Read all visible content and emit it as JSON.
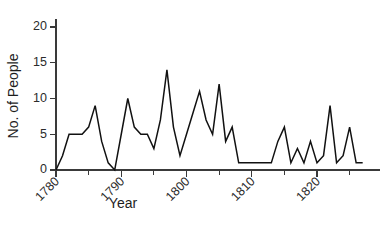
{
  "chart_data": {
    "type": "line",
    "title": "",
    "xlabel": "Year",
    "ylabel": "No. of People",
    "xlim": [
      1780,
      1827
    ],
    "ylim": [
      0,
      22
    ],
    "grid": false,
    "legend": null,
    "y_ticks": [
      0,
      5,
      10,
      15,
      20
    ],
    "y_tick_labels": [
      "0",
      "5",
      "10",
      "15",
      "20"
    ],
    "x_major_ticks": [
      1780,
      1790,
      1800,
      1810,
      1820
    ],
    "x_major_tick_labels": [
      "1780",
      "1790",
      "1800",
      "1810",
      "1820"
    ],
    "x_minor_ticks": [
      1785,
      1795,
      1805,
      1815,
      1825
    ],
    "x_tick_label_rotation": -45,
    "series": [
      {
        "name": "No. of People",
        "color": "#111111",
        "x": [
          1780,
          1781,
          1782,
          1783,
          1784,
          1785,
          1786,
          1787,
          1788,
          1789,
          1790,
          1791,
          1792,
          1793,
          1794,
          1795,
          1796,
          1797,
          1798,
          1799,
          1800,
          1801,
          1802,
          1803,
          1804,
          1805,
          1806,
          1807,
          1808,
          1809,
          1810,
          1811,
          1812,
          1813,
          1814,
          1815,
          1816,
          1817,
          1818,
          1819,
          1820,
          1821,
          1822,
          1823,
          1824,
          1825,
          1826,
          1827
        ],
        "values": [
          0,
          2,
          5,
          5,
          5,
          6,
          9,
          4,
          1,
          0,
          5,
          10,
          6,
          5,
          5,
          3,
          7,
          14,
          6,
          2,
          5,
          8,
          11,
          7,
          5,
          12,
          4,
          6,
          1,
          1,
          1,
          1,
          1,
          1,
          4,
          6,
          1,
          3,
          1,
          4,
          1,
          2,
          9,
          1,
          2,
          6,
          1,
          1
        ]
      }
    ]
  },
  "axes": {
    "y_label_text": "No. of People",
    "x_label_text": "Year"
  }
}
